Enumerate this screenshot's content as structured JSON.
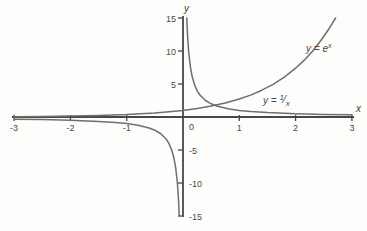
{
  "figure": {
    "background": "#fdfdfc",
    "axis_color": "#474747",
    "curve_color": "#6e6e6e",
    "text_color": "#4a4a4a"
  },
  "chart_data": {
    "type": "line",
    "title": "",
    "xlabel": "x",
    "ylabel": "y",
    "xlim": [
      -3,
      3
    ],
    "ylim": [
      -15,
      15
    ],
    "grid": false,
    "x_ticks": [
      -3,
      -2,
      -1,
      0,
      1,
      2,
      3
    ],
    "y_ticks": [
      -15,
      -10,
      -5,
      5,
      10,
      15
    ],
    "legend_position": "on-curve",
    "series": [
      {
        "name": "exp-curve",
        "label": "y = e^x",
        "points": [
          [
            -3,
            0.05
          ],
          [
            -2.5,
            0.08
          ],
          [
            -2,
            0.14
          ],
          [
            -1.5,
            0.22
          ],
          [
            -1,
            0.37
          ],
          [
            -0.5,
            0.61
          ],
          [
            0,
            1
          ],
          [
            0.25,
            1.28
          ],
          [
            0.5,
            1.65
          ],
          [
            0.75,
            2.12
          ],
          [
            1,
            2.72
          ],
          [
            1.2,
            3.32
          ],
          [
            1.4,
            4.06
          ],
          [
            1.6,
            4.95
          ],
          [
            1.8,
            6.05
          ],
          [
            2,
            7.39
          ],
          [
            2.15,
            8.58
          ],
          [
            2.3,
            9.97
          ],
          [
            2.45,
            11.59
          ],
          [
            2.6,
            13.46
          ],
          [
            2.71,
            15
          ]
        ]
      },
      {
        "name": "reciprocal-negative-branch",
        "label": "y = 1/x (x<0)",
        "points": [
          [
            -3,
            -0.33
          ],
          [
            -2.5,
            -0.4
          ],
          [
            -2,
            -0.5
          ],
          [
            -1.5,
            -0.67
          ],
          [
            -1.2,
            -0.83
          ],
          [
            -1,
            -1
          ],
          [
            -0.8,
            -1.25
          ],
          [
            -0.6,
            -1.67
          ],
          [
            -0.5,
            -2
          ],
          [
            -0.4,
            -2.5
          ],
          [
            -0.3,
            -3.33
          ],
          [
            -0.25,
            -4
          ],
          [
            -0.2,
            -5
          ],
          [
            -0.16,
            -6.25
          ],
          [
            -0.13,
            -7.69
          ],
          [
            -0.1,
            -10
          ],
          [
            -0.08,
            -12.5
          ],
          [
            -0.067,
            -15
          ]
        ]
      },
      {
        "name": "reciprocal-positive-branch",
        "label": "y = 1/x (x>0)",
        "points": [
          [
            0.067,
            15
          ],
          [
            0.08,
            12.5
          ],
          [
            0.1,
            10
          ],
          [
            0.13,
            7.69
          ],
          [
            0.16,
            6.25
          ],
          [
            0.2,
            5
          ],
          [
            0.25,
            4
          ],
          [
            0.3,
            3.33
          ],
          [
            0.4,
            2.5
          ],
          [
            0.5,
            2
          ],
          [
            0.6,
            1.67
          ],
          [
            0.8,
            1.25
          ],
          [
            1,
            1
          ],
          [
            1.2,
            0.83
          ],
          [
            1.5,
            0.67
          ],
          [
            2,
            0.5
          ],
          [
            2.5,
            0.4
          ],
          [
            3,
            0.33
          ]
        ]
      }
    ]
  },
  "labels": {
    "exp": {
      "prefix": "y = e",
      "sup": "x"
    },
    "recip": {
      "prefix": "y = ",
      "num": "1",
      "slash": "⁄",
      "den": "x"
    }
  }
}
